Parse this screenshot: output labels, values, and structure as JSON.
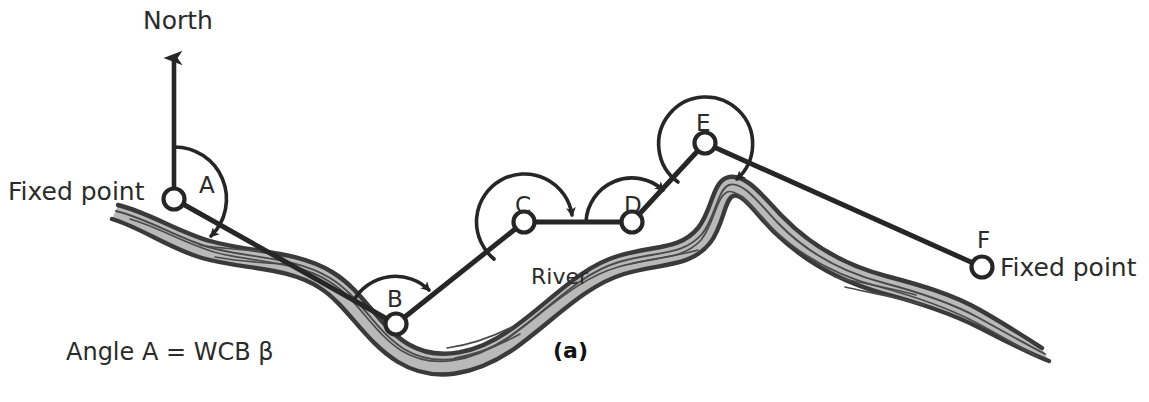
{
  "figure": {
    "caption": "(a)",
    "north_label": "North",
    "river_label": "River",
    "equation_label": "Angle A = WCB β",
    "fixed_point_left": "Fixed point",
    "fixed_point_right": "Fixed point",
    "colors": {
      "line": "#262626",
      "river_fill": "#b9b9b9",
      "river_outline": "#3a3a3a",
      "text": "#2b2b2b",
      "background": "#ffffff"
    }
  },
  "stations": [
    {
      "id": "A",
      "label": "A",
      "x": 174,
      "y": 199
    },
    {
      "id": "B",
      "label": "B",
      "x": 396,
      "y": 324
    },
    {
      "id": "C",
      "label": "C",
      "x": 524,
      "y": 222
    },
    {
      "id": "D",
      "label": "D",
      "x": 632,
      "y": 222
    },
    {
      "id": "E",
      "label": "E",
      "x": 705,
      "y": 143
    },
    {
      "id": "F",
      "label": "F",
      "x": 982,
      "y": 267
    }
  ],
  "station_label_positions": [
    {
      "id": "A",
      "x": 199,
      "y": 193
    },
    {
      "id": "B",
      "x": 387,
      "y": 307
    },
    {
      "id": "C",
      "x": 515,
      "y": 213
    },
    {
      "id": "D",
      "x": 624,
      "y": 213
    },
    {
      "id": "E",
      "x": 696,
      "y": 131
    },
    {
      "id": "F",
      "x": 977,
      "y": 248
    }
  ],
  "traverse_legs": [
    {
      "from": "A",
      "to": "B"
    },
    {
      "from": "B",
      "to": "C"
    },
    {
      "from": "C",
      "to": "D"
    },
    {
      "from": "D",
      "to": "E"
    },
    {
      "from": "E",
      "to": "F"
    }
  ],
  "north_arrow": {
    "x": 174,
    "y_top": 46,
    "y_bottom": 199
  },
  "angle_arcs": [
    {
      "at": "A",
      "radius": 52
    },
    {
      "at": "B",
      "radius": 48
    },
    {
      "at": "C",
      "radius": 48
    },
    {
      "at": "D",
      "radius": 46
    },
    {
      "at": "E",
      "radius": 47
    }
  ],
  "text_positions": {
    "north": {
      "x": 143,
      "y": 29
    },
    "fixed_point_left": {
      "x": 8,
      "y": 200
    },
    "fixed_point_right": {
      "x": 1000,
      "y": 276
    },
    "river": {
      "x": 531,
      "y": 284
    },
    "equation": {
      "x": 66,
      "y": 360
    },
    "caption": {
      "x": 553,
      "y": 358
    }
  }
}
